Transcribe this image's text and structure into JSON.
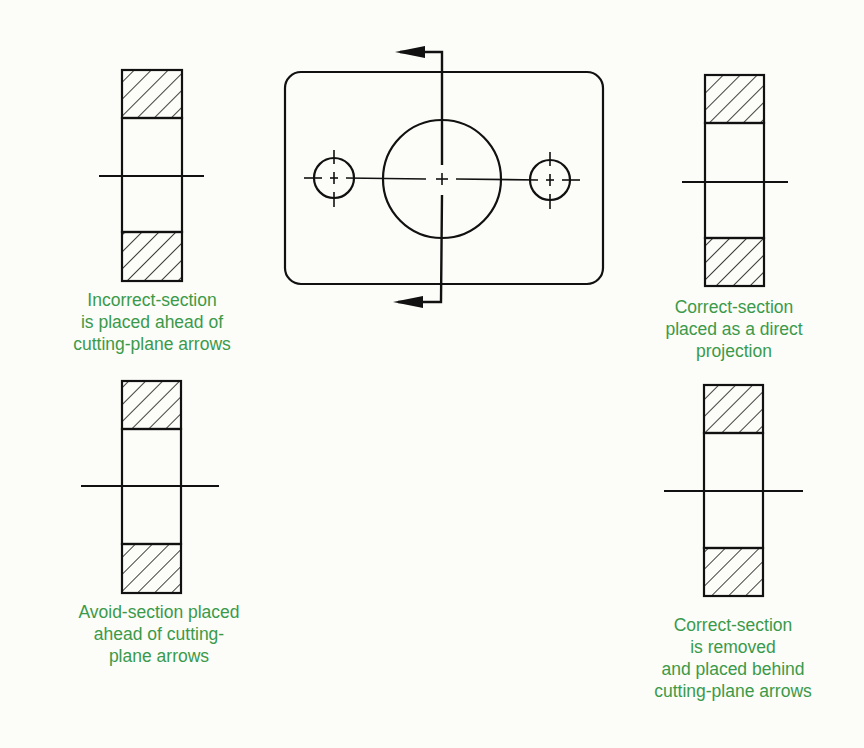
{
  "figure": {
    "colors": {
      "line": "#111111",
      "caption": "#3a9a4a",
      "background": "#fcfcf8"
    },
    "main_view": {
      "description": "Rectangular plate with rounded corners, one large central hole and two small holes, cut by a vertical cutting plane whose arrows point left"
    },
    "sections": [
      {
        "id": "incorrect",
        "caption_lines": [
          "Incorrect-section",
          "is placed ahead of",
          "cutting-plane arrows"
        ]
      },
      {
        "id": "correct-projection",
        "caption_lines": [
          "Correct-section",
          "placed as a direct",
          "projection"
        ]
      },
      {
        "id": "avoid",
        "caption_lines": [
          "Avoid-section placed",
          "ahead of cutting-",
          "plane arrows"
        ]
      },
      {
        "id": "correct-removed",
        "caption_lines": [
          "Correct-section",
          "is removed",
          "and placed behind",
          "cutting-plane arrows"
        ]
      }
    ]
  }
}
